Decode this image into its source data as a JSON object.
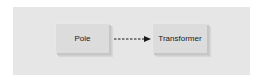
{
  "diagram": {
    "nodes": [
      {
        "id": "pole",
        "label": "Pole"
      },
      {
        "id": "transformer",
        "label": "Transformer"
      }
    ],
    "edges": [
      {
        "from": "pole",
        "to": "transformer",
        "style": "dashed",
        "arrowhead": "filled-triangle"
      }
    ],
    "colors": {
      "panel_background": "#e6e6e6",
      "node_fill": "#dcdcdc",
      "node_shadow": "#c6c6c6",
      "text": "#1a1a1a",
      "edge": "#1a1a1a"
    }
  }
}
